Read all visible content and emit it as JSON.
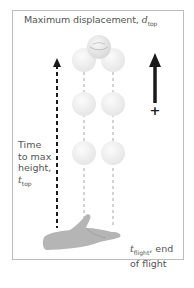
{
  "title": {
    "prefix": "Maximum displacement, ",
    "symbol": "d",
    "subscript": "top"
  },
  "side_label": {
    "line1": "Time",
    "line2": "to max",
    "line3": "height,",
    "symbol": "t",
    "subscript": "top"
  },
  "end_label": {
    "symbol": "t",
    "subscript": "flight",
    "suffix": ", end",
    "line2": "of flight"
  },
  "direction": {
    "sign": "+"
  },
  "colors": {
    "frame": "#bdbdbd",
    "text": "#555555",
    "arrow": "#1a1a1a",
    "ball": "#e6e6e6",
    "hand": "#b5b5b5"
  }
}
